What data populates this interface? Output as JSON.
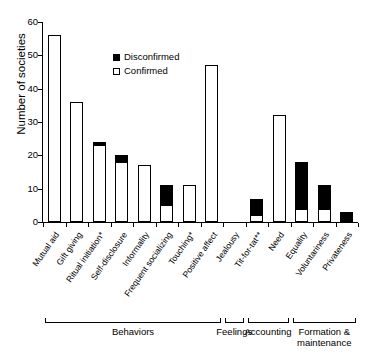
{
  "chart_data": {
    "type": "bar",
    "title": "",
    "xlabel": "",
    "ylabel": "Number of societies",
    "ylim": [
      0,
      60
    ],
    "yticks": [
      0,
      10,
      20,
      30,
      40,
      50,
      60
    ],
    "grid": false,
    "stacked": true,
    "legend_position": "inside-top-left",
    "categories": [
      "Mutual aid",
      "Gift giving",
      "Ritual initiation*",
      "Self-disclosure",
      "Informality",
      "Frequent socializing",
      "Touching*",
      "Positive affect",
      "Jealousy",
      "Tit-for-tat**",
      "Need",
      "Equality",
      "Voluntariness",
      "Privateness"
    ],
    "series": [
      {
        "name": "Confirmed",
        "color": "#ffffff",
        "values": [
          56,
          36,
          23,
          18,
          17,
          5,
          11,
          47,
          0,
          2,
          32,
          4,
          4,
          0
        ]
      },
      {
        "name": "Disconfirmed",
        "color": "#000000",
        "values": [
          0,
          0,
          1,
          2,
          0,
          6,
          0,
          0,
          0,
          5,
          0,
          14,
          7,
          3
        ]
      }
    ],
    "totals": [
      56,
      36,
      24,
      20,
      17,
      11,
      11,
      47,
      0,
      7,
      32,
      18,
      11,
      3
    ],
    "groups": [
      {
        "label": "Behaviors",
        "from": 0,
        "to": 7
      },
      {
        "label": "Feelings",
        "from": 8,
        "to": 8
      },
      {
        "label": "Accounting",
        "from": 9,
        "to": 10
      },
      {
        "label": "Formation & maintenance",
        "from": 11,
        "to": 13
      }
    ]
  },
  "legend": {
    "items": [
      {
        "label": "Disconfirmed",
        "swatch": "filled-square-icon"
      },
      {
        "label": "Confirmed",
        "swatch": "open-square-icon"
      }
    ]
  }
}
